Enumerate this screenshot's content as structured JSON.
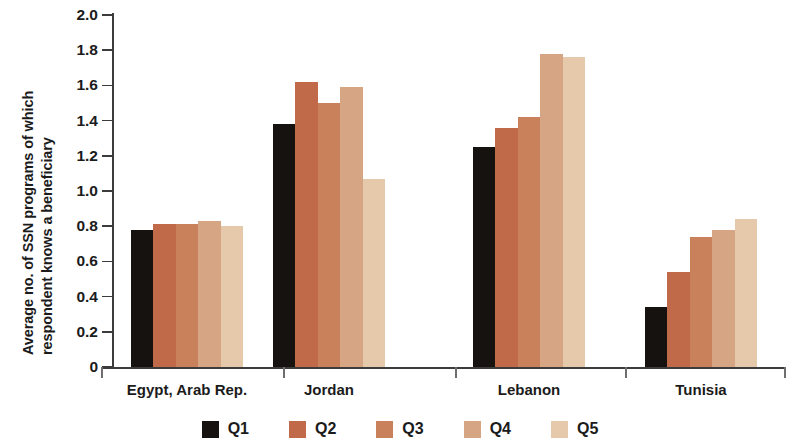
{
  "chart_data": {
    "type": "bar",
    "title": "",
    "xlabel": "",
    "ylabel": "Average no. of SSN programs of which respondent knows a beneficiary",
    "ylabel_line1": "Average no. of SSN programs of which",
    "ylabel_line2": "respondent knows a beneficiary",
    "categories": [
      "Egypt, Arab Rep.",
      "Jordan",
      "Lebanon",
      "Tunisia"
    ],
    "series": [
      {
        "name": "Q1",
        "color": "#151210",
        "values": [
          0.78,
          1.38,
          1.25,
          0.34
        ]
      },
      {
        "name": "Q2",
        "color": "#c06a4a",
        "values": [
          0.81,
          1.62,
          1.36,
          0.54
        ]
      },
      {
        "name": "Q3",
        "color": "#c9815b",
        "values": [
          0.81,
          1.5,
          1.42,
          0.74
        ]
      },
      {
        "name": "Q4",
        "color": "#d6a684",
        "values": [
          0.83,
          1.59,
          1.78,
          0.78
        ]
      },
      {
        "name": "Q5",
        "color": "#e6c8aa",
        "values": [
          0.8,
          1.07,
          1.76,
          0.84
        ]
      }
    ],
    "ylim": [
      0,
      2.0
    ],
    "ytick_values": [
      0,
      0.2,
      0.4,
      0.6,
      0.8,
      1.0,
      1.2,
      1.4,
      1.6,
      1.8,
      2.0
    ],
    "ytick_labels": [
      "0",
      "0.2",
      "0.4",
      "0.6",
      "0.8",
      "1.0",
      "1.2",
      "1.4",
      "1.6",
      "1.8",
      "2.0"
    ],
    "grid": false,
    "legend_position": "bottom",
    "legend_entries": [
      "Q1",
      "Q2",
      "Q3",
      "Q4",
      "Q5"
    ],
    "axis_color": "#3c3c3c",
    "background_color": "#ffffff"
  }
}
